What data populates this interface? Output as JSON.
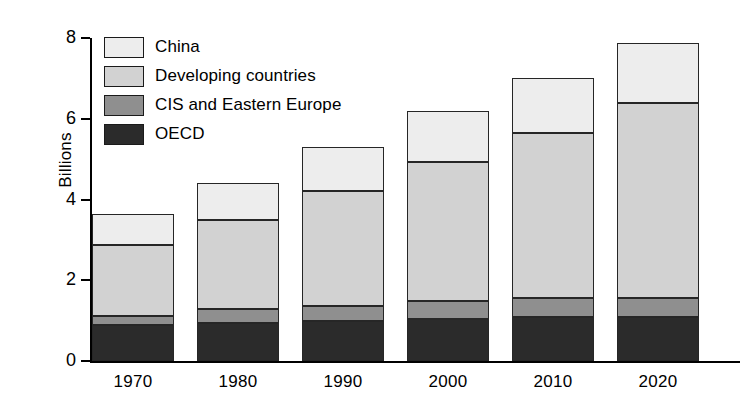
{
  "chart_data": {
    "type": "bar",
    "subtype": "stacked-vertical",
    "title": "",
    "xlabel": "",
    "ylabel": "Billions",
    "categories": [
      "1970",
      "1980",
      "1990",
      "2000",
      "2010",
      "2020"
    ],
    "series": [
      {
        "name": "OECD",
        "color": "#2b2b2b",
        "values": [
          0.88,
          0.95,
          1.0,
          1.05,
          1.08,
          1.1
        ]
      },
      {
        "name": "CIS and Eastern Europe",
        "color": "#8f8f8f",
        "values": [
          0.24,
          0.33,
          0.35,
          0.43,
          0.49,
          0.46
        ]
      },
      {
        "name": "Developing countries",
        "color": "#d2d2d2",
        "values": [
          1.76,
          2.22,
          2.85,
          3.45,
          4.08,
          4.84
        ]
      },
      {
        "name": "China",
        "color": "#ededed",
        "values": [
          0.77,
          0.9,
          1.1,
          1.27,
          1.35,
          1.47
        ]
      }
    ],
    "totals": [
      3.65,
      4.4,
      5.3,
      6.2,
      7.0,
      7.87
    ],
    "ylim": [
      0,
      8
    ],
    "yticks": [
      0,
      2,
      4,
      6,
      8
    ],
    "ytick_labels": [
      "0",
      "2",
      "4",
      "6",
      "8"
    ],
    "grid": false,
    "legend_position": "top-left",
    "legend_order": [
      "China",
      "Developing countries",
      "CIS and Eastern Europe",
      "OECD"
    ]
  },
  "legend": {
    "items": [
      {
        "label": "China",
        "swatch": "#ededed"
      },
      {
        "label": "Developing countries",
        "swatch": "#d2d2d2"
      },
      {
        "label": "CIS and Eastern Europe",
        "swatch": "#8f8f8f"
      },
      {
        "label": "OECD",
        "swatch": "#2b2b2b"
      }
    ]
  },
  "axes": {
    "y_title": "Billions",
    "y_tick_labels": [
      "8",
      "6",
      "4",
      "2",
      "0"
    ],
    "x_tick_labels": [
      "1970",
      "1980",
      "1990",
      "2000",
      "2010",
      "2020"
    ]
  }
}
